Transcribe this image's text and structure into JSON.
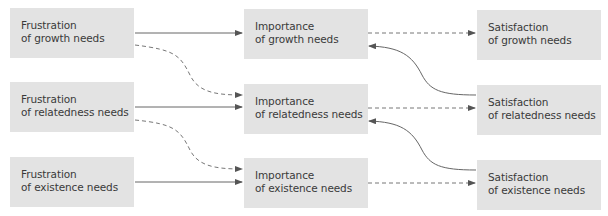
{
  "diagram": {
    "type": "flow",
    "colors": {
      "box_fill": "#e3e3e3",
      "text": "#3a3a3a",
      "line": "#555555"
    },
    "nodes": [
      {
        "id": "frustration-growth",
        "line1": "Frustration",
        "line2": "of growth needs"
      },
      {
        "id": "frustration-relatedness",
        "line1": "Frustration",
        "line2": "of relatedness needs"
      },
      {
        "id": "frustration-existence",
        "line1": "Frustration",
        "line2": "of existence needs"
      },
      {
        "id": "importance-growth",
        "line1": "Importance",
        "line2": "of growth needs"
      },
      {
        "id": "importance-relatedness",
        "line1": "Importance",
        "line2": "of relatedness needs"
      },
      {
        "id": "importance-existence",
        "line1": "Importance",
        "line2": "of existence needs"
      },
      {
        "id": "satisfaction-growth",
        "line1": "Satisfaction",
        "line2": "of growth needs"
      },
      {
        "id": "satisfaction-relatedness",
        "line1": "Satisfaction",
        "line2": "of relatedness needs"
      },
      {
        "id": "satisfaction-existence",
        "line1": "Satisfaction",
        "line2": "of existence needs"
      }
    ],
    "edges": [
      {
        "from": "frustration-growth",
        "to": "importance-growth",
        "style": "solid"
      },
      {
        "from": "frustration-growth",
        "to": "importance-relatedness",
        "style": "dashed"
      },
      {
        "from": "frustration-relatedness",
        "to": "importance-relatedness",
        "style": "solid"
      },
      {
        "from": "frustration-relatedness",
        "to": "importance-existence",
        "style": "dashed"
      },
      {
        "from": "frustration-existence",
        "to": "importance-existence",
        "style": "solid"
      },
      {
        "from": "importance-growth",
        "to": "satisfaction-growth",
        "style": "dashed"
      },
      {
        "from": "importance-relatedness",
        "to": "satisfaction-relatedness",
        "style": "dashed"
      },
      {
        "from": "importance-existence",
        "to": "satisfaction-existence",
        "style": "dashed"
      },
      {
        "from": "satisfaction-relatedness",
        "to": "importance-growth",
        "style": "solid"
      },
      {
        "from": "satisfaction-existence",
        "to": "importance-relatedness",
        "style": "solid"
      }
    ]
  }
}
